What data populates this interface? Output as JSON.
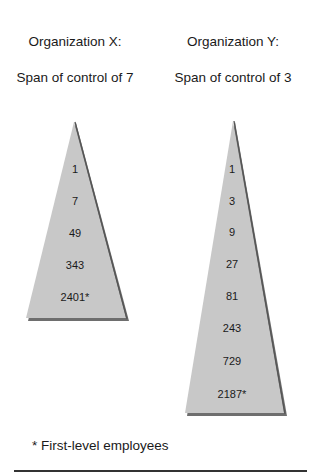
{
  "organizations": [
    {
      "title": "Organization X:",
      "subtitle": "Span of control of 7",
      "levels": [
        "1",
        "7",
        "49",
        "343",
        "2401*"
      ]
    },
    {
      "title": "Organization Y:",
      "subtitle": "Span of control of 3",
      "levels": [
        "1",
        "3",
        "9",
        "27",
        "81",
        "243",
        "729",
        "2187*"
      ]
    }
  ],
  "footnote": "* First-level employees",
  "colors": {
    "triangle_fill": "#c8c8c8",
    "triangle_shadow": "#6e6e6e"
  }
}
